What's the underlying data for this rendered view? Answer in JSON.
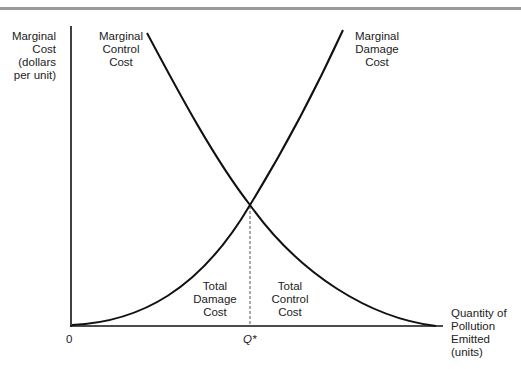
{
  "diagram": {
    "title": "",
    "y_axis_label": [
      "Marginal",
      "Cost",
      "(dollars",
      "per unit)"
    ],
    "x_axis_label": [
      "Quantity of",
      "Pollution",
      "Emitted",
      "(units)"
    ],
    "origin_label": "0",
    "equilibrium_label": "Q*",
    "curves": {
      "control": {
        "label": [
          "Marginal",
          "Control",
          "Cost"
        ],
        "shape": "decreasing convex"
      },
      "damage": {
        "label": [
          "Marginal",
          "Damage",
          "Cost"
        ],
        "shape": "increasing convex"
      }
    },
    "areas": {
      "damage": [
        "Total",
        "Damage",
        "Cost"
      ],
      "control": [
        "Total",
        "Control",
        "Cost"
      ]
    },
    "colors": {
      "line": "#111111",
      "rule": "#9a9a9a",
      "dash": "#555555"
    }
  }
}
